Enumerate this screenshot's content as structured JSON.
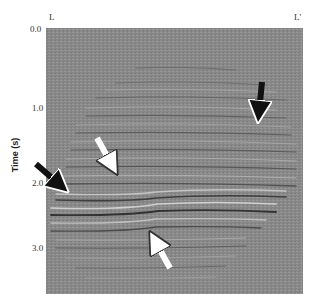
{
  "figure": {
    "top_labels": {
      "left": "L",
      "right": "L'"
    },
    "y_axis": {
      "label": "Time (s)",
      "ticks": [
        {
          "label": "0.0",
          "y": 31
        },
        {
          "label": "1.0",
          "y": 107
        },
        {
          "label": "2.0",
          "y": 182
        },
        {
          "label": "3.0",
          "y": 247
        }
      ]
    },
    "background_color": "#8a8a8a",
    "arrows": [
      {
        "color": "#111111",
        "direction": "down",
        "x1": 262,
        "y1": 82,
        "x2": 258,
        "y2": 124
      },
      {
        "color": "#ffffff",
        "direction": "down-right",
        "x1": 97,
        "y1": 138,
        "x2": 119,
        "y2": 176
      },
      {
        "color": "#111111",
        "direction": "down-right",
        "x1": 36,
        "y1": 164,
        "x2": 68,
        "y2": 193
      },
      {
        "color": "#ffffff",
        "direction": "up-left",
        "x1": 170,
        "y1": 268,
        "x2": 149,
        "y2": 230
      }
    ]
  }
}
